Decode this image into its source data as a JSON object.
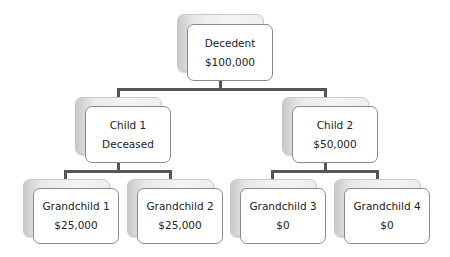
{
  "diagram": {
    "type": "hierarchy",
    "root": {
      "title": "Decedent",
      "value": "$100,000"
    },
    "children": [
      {
        "title": "Child 1",
        "value": "Deceased",
        "children": [
          {
            "title": "Grandchild 1",
            "value": "$25,000"
          },
          {
            "title": "Grandchild 2",
            "value": "$25,000"
          }
        ]
      },
      {
        "title": "Child 2",
        "value": "$50,000",
        "children": [
          {
            "title": "Grandchild 3",
            "value": "$0"
          },
          {
            "title": "Grandchild 4",
            "value": "$0"
          }
        ]
      }
    ]
  },
  "colors": {
    "connector": "#555555",
    "card_border": "#8a8a8a",
    "card_fill": "#ffffff",
    "shadow_card": "#e9e9e9"
  }
}
